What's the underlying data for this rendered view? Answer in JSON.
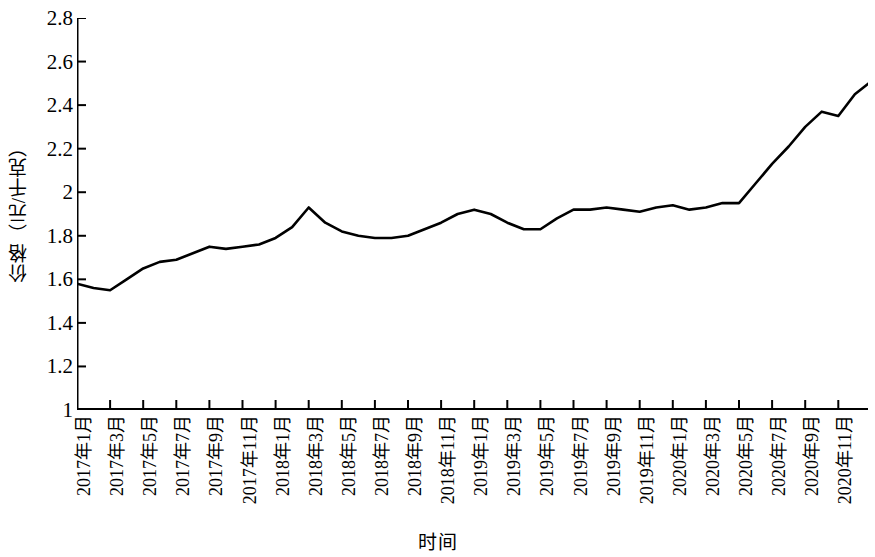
{
  "chart_data": {
    "type": "line",
    "title": "",
    "xlabel": "时间",
    "ylabel": "价格（元/千克）",
    "ylim": [
      1,
      2.8
    ],
    "y_ticks": [
      "1",
      "1.2",
      "1.4",
      "1.6",
      "1.8",
      "2",
      "2.2",
      "2.4",
      "2.6",
      "2.8"
    ],
    "y_tick_values": [
      1,
      1.2,
      1.4,
      1.6,
      1.8,
      2,
      2.2,
      2.4,
      2.6,
      2.8
    ],
    "grid": false,
    "legend": null,
    "line_color": "#000000",
    "x": [
      "2017年1月",
      "2017年2月",
      "2017年3月",
      "2017年4月",
      "2017年5月",
      "2017年6月",
      "2017年7月",
      "2017年8月",
      "2017年9月",
      "2017年10月",
      "2017年11月",
      "2017年12月",
      "2018年1月",
      "2018年2月",
      "2018年3月",
      "2018年4月",
      "2018年5月",
      "2018年6月",
      "2018年7月",
      "2018年8月",
      "2018年9月",
      "2018年10月",
      "2018年11月",
      "2018年12月",
      "2019年1月",
      "2019年2月",
      "2019年3月",
      "2019年4月",
      "2019年5月",
      "2019年6月",
      "2019年7月",
      "2019年8月",
      "2019年9月",
      "2019年10月",
      "2019年11月",
      "2019年12月",
      "2020年1月",
      "2020年2月",
      "2020年3月",
      "2020年4月",
      "2020年5月",
      "2020年6月",
      "2020年7月",
      "2020年8月",
      "2020年9月",
      "2020年10月",
      "2020年11月",
      "2020年12月"
    ],
    "x_tick_labels": [
      "2017年1月",
      "2017年3月",
      "2017年5月",
      "2017年7月",
      "2017年9月",
      "2017年11月",
      "2018年1月",
      "2018年3月",
      "2018年5月",
      "2018年7月",
      "2018年9月",
      "2018年11月",
      "2019年1月",
      "2019年3月",
      "2019年5月",
      "2019年7月",
      "2019年9月",
      "2019年11月",
      "2020年1月",
      "2020年3月",
      "2020年5月",
      "2020年7月",
      "2020年9月",
      "2020年11月"
    ],
    "values": [
      1.58,
      1.56,
      1.55,
      1.6,
      1.65,
      1.68,
      1.69,
      1.72,
      1.75,
      1.74,
      1.75,
      1.76,
      1.79,
      1.84,
      1.93,
      1.86,
      1.82,
      1.8,
      1.79,
      1.79,
      1.8,
      1.83,
      1.86,
      1.9,
      1.92,
      1.9,
      1.86,
      1.83,
      1.83,
      1.88,
      1.92,
      1.92,
      1.93,
      1.92,
      1.91,
      1.93,
      1.94,
      1.92,
      1.93,
      1.95,
      1.95,
      2.04,
      2.13,
      2.21,
      2.3,
      2.37,
      2.35,
      2.45
    ],
    "values_tail": [
      2.51,
      2.57
    ]
  }
}
